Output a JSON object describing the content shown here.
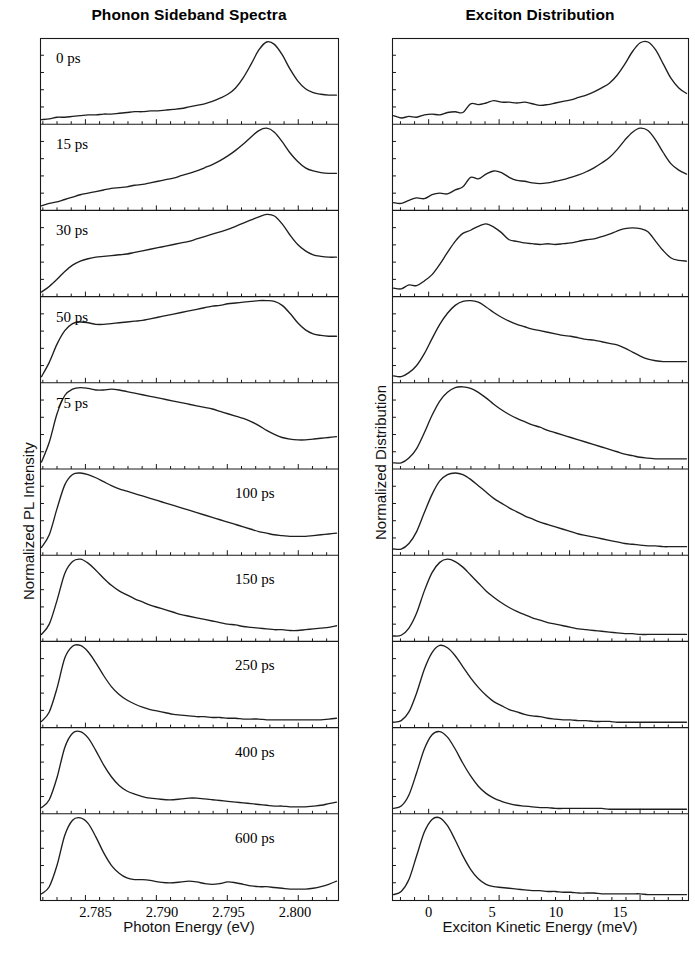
{
  "figure": {
    "columns": [
      {
        "key": "left",
        "title": "Phonon Sideband Spectra",
        "xlabel": "Photon Energy (eV)",
        "ylabel": "Normalized PL Intensity",
        "xticks": [
          "2.785",
          "2.790",
          "2.795",
          "2.800"
        ],
        "xtick_px": [
          95.5,
          162.0,
          228.5,
          295.0
        ]
      },
      {
        "key": "right",
        "title": "Exciton Distribution",
        "xlabel": "Exciton Kinetic Energy (meV)",
        "ylabel": "Normalized Distribution",
        "xticks": [
          "0",
          "5",
          "10",
          "15"
        ],
        "xtick_px": [
          428.5,
          492.0,
          556.0,
          620.0
        ]
      }
    ],
    "panel_labels": [
      "0 ps",
      "15 ps",
      "30 ps",
      "50 ps",
      "75 ps",
      "100 ps",
      "150 ps",
      "250 ps",
      "400 ps",
      "600 ps"
    ],
    "panel_label_side": [
      "left",
      "left",
      "left",
      "left",
      "left",
      "right",
      "right",
      "right",
      "right",
      "right"
    ],
    "colors": {
      "line": "#1f1f1f",
      "frame": "#1a1a1a",
      "background": "#ffffff",
      "text": "#000000"
    }
  },
  "chart_data": {
    "type": "line",
    "layout": "2 columns x 10 stacked time-delay panels, shared x axis per column",
    "grid": false,
    "legend": "none (each panel annotated with its time delay)",
    "time_delays_ps": [
      0,
      15,
      30,
      50,
      75,
      100,
      150,
      250,
      400,
      600
    ],
    "panels": [
      {
        "column": "left",
        "xlabel": "Photon Energy (eV)",
        "ylabel": "Normalized PL Intensity",
        "xlim": [
          2.7818,
          2.8028
        ],
        "xticks": [
          2.785,
          2.79,
          2.795,
          2.8
        ],
        "ylim": [
          0,
          1.05
        ],
        "series": [
          {
            "name": "0 ps",
            "y": [
              0.02,
              0.03,
              0.05,
              0.05,
              0.06,
              0.07,
              0.08,
              0.08,
              0.09,
              0.09,
              0.1,
              0.11,
              0.12,
              0.12,
              0.13,
              0.13,
              0.14,
              0.15,
              0.16,
              0.18,
              0.2,
              0.22,
              0.25,
              0.29,
              0.34,
              0.42,
              0.55,
              0.72,
              0.9,
              1.0,
              0.97,
              0.84,
              0.66,
              0.51,
              0.41,
              0.36,
              0.34,
              0.33,
              0.33
            ]
          },
          {
            "name": "15 ps",
            "y": [
              0.02,
              0.05,
              0.07,
              0.1,
              0.13,
              0.16,
              0.18,
              0.2,
              0.22,
              0.24,
              0.25,
              0.26,
              0.28,
              0.29,
              0.31,
              0.33,
              0.35,
              0.37,
              0.4,
              0.43,
              0.46,
              0.5,
              0.54,
              0.59,
              0.65,
              0.72,
              0.8,
              0.89,
              0.97,
              1.0,
              0.95,
              0.83,
              0.69,
              0.58,
              0.5,
              0.46,
              0.44,
              0.43,
              0.43
            ]
          },
          {
            "name": "30 ps",
            "y": [
              0.02,
              0.09,
              0.18,
              0.28,
              0.36,
              0.41,
              0.44,
              0.46,
              0.47,
              0.48,
              0.49,
              0.5,
              0.52,
              0.54,
              0.56,
              0.58,
              0.6,
              0.62,
              0.64,
              0.66,
              0.69,
              0.72,
              0.75,
              0.78,
              0.81,
              0.85,
              0.89,
              0.93,
              0.97,
              1.0,
              0.98,
              0.88,
              0.74,
              0.62,
              0.54,
              0.49,
              0.47,
              0.46,
              0.46
            ]
          },
          {
            "name": "50 ps",
            "y": [
              0.04,
              0.22,
              0.45,
              0.62,
              0.71,
              0.73,
              0.72,
              0.7,
              0.7,
              0.71,
              0.72,
              0.73,
              0.74,
              0.75,
              0.77,
              0.79,
              0.81,
              0.83,
              0.85,
              0.87,
              0.89,
              0.91,
              0.93,
              0.94,
              0.96,
              0.97,
              0.98,
              0.99,
              1.0,
              1.0,
              0.99,
              0.94,
              0.84,
              0.72,
              0.63,
              0.58,
              0.56,
              0.55,
              0.55
            ]
          },
          {
            "name": "75 ps",
            "y": [
              0.05,
              0.3,
              0.66,
              0.89,
              0.97,
              0.99,
              0.98,
              0.96,
              0.96,
              0.97,
              0.96,
              0.94,
              0.92,
              0.9,
              0.88,
              0.86,
              0.84,
              0.82,
              0.8,
              0.78,
              0.76,
              0.74,
              0.72,
              0.69,
              0.66,
              0.63,
              0.6,
              0.56,
              0.51,
              0.45,
              0.4,
              0.36,
              0.34,
              0.33,
              0.33,
              0.34,
              0.35,
              0.36,
              0.37
            ]
          },
          {
            "name": "100 ps",
            "y": [
              0.06,
              0.22,
              0.55,
              0.85,
              0.98,
              1.0,
              0.98,
              0.94,
              0.89,
              0.84,
              0.8,
              0.77,
              0.74,
              0.71,
              0.68,
              0.65,
              0.62,
              0.59,
              0.56,
              0.53,
              0.5,
              0.47,
              0.44,
              0.41,
              0.38,
              0.35,
              0.32,
              0.29,
              0.26,
              0.24,
              0.22,
              0.21,
              0.2,
              0.2,
              0.2,
              0.21,
              0.22,
              0.23,
              0.24
            ]
          },
          {
            "name": "150 ps",
            "y": [
              0.05,
              0.18,
              0.48,
              0.82,
              0.97,
              1.0,
              0.95,
              0.86,
              0.76,
              0.67,
              0.6,
              0.55,
              0.5,
              0.46,
              0.42,
              0.39,
              0.36,
              0.33,
              0.3,
              0.28,
              0.26,
              0.24,
              0.22,
              0.2,
              0.18,
              0.17,
              0.15,
              0.14,
              0.13,
              0.12,
              0.11,
              0.11,
              0.1,
              0.1,
              0.11,
              0.12,
              0.13,
              0.14,
              0.16
            ]
          },
          {
            "name": "250 ps",
            "y": [
              0.04,
              0.16,
              0.46,
              0.84,
              0.99,
              1.0,
              0.92,
              0.78,
              0.62,
              0.48,
              0.38,
              0.31,
              0.26,
              0.22,
              0.19,
              0.17,
              0.15,
              0.13,
              0.12,
              0.11,
              0.1,
              0.1,
              0.09,
              0.09,
              0.08,
              0.08,
              0.07,
              0.07,
              0.07,
              0.06,
              0.06,
              0.06,
              0.06,
              0.06,
              0.06,
              0.06,
              0.06,
              0.07,
              0.08
            ]
          },
          {
            "name": "400 ps",
            "y": [
              0.04,
              0.14,
              0.42,
              0.8,
              0.98,
              1.0,
              0.92,
              0.76,
              0.58,
              0.43,
              0.32,
              0.25,
              0.21,
              0.18,
              0.16,
              0.15,
              0.14,
              0.14,
              0.15,
              0.16,
              0.16,
              0.15,
              0.14,
              0.13,
              0.12,
              0.11,
              0.1,
              0.09,
              0.08,
              0.07,
              0.06,
              0.06,
              0.05,
              0.05,
              0.05,
              0.06,
              0.07,
              0.09,
              0.11
            ]
          },
          {
            "name": "600 ps",
            "y": [
              0.04,
              0.13,
              0.4,
              0.78,
              0.97,
              1.0,
              0.93,
              0.76,
              0.56,
              0.4,
              0.3,
              0.24,
              0.22,
              0.22,
              0.21,
              0.19,
              0.18,
              0.18,
              0.19,
              0.2,
              0.19,
              0.17,
              0.16,
              0.17,
              0.19,
              0.18,
              0.16,
              0.14,
              0.13,
              0.13,
              0.12,
              0.11,
              0.1,
              0.1,
              0.1,
              0.11,
              0.13,
              0.16,
              0.2
            ]
          }
        ]
      },
      {
        "column": "right",
        "xlabel": "Exciton Kinetic Energy (meV)",
        "ylabel": "Normalized Distribution",
        "xlim": [
          -2.6,
          18.4
        ],
        "xticks": [
          0,
          5,
          10,
          15
        ],
        "ylim": [
          0,
          1.05
        ],
        "series": [
          {
            "name": "0 ps",
            "y": [
              0.07,
              0.04,
              0.06,
              0.05,
              0.08,
              0.09,
              0.08,
              0.11,
              0.12,
              0.11,
              0.22,
              0.21,
              0.23,
              0.26,
              0.24,
              0.24,
              0.23,
              0.24,
              0.22,
              0.2,
              0.21,
              0.23,
              0.25,
              0.27,
              0.3,
              0.33,
              0.37,
              0.42,
              0.48,
              0.58,
              0.72,
              0.88,
              0.99,
              1.0,
              0.9,
              0.72,
              0.54,
              0.42,
              0.35
            ]
          },
          {
            "name": "15 ps",
            "y": [
              0.06,
              0.05,
              0.09,
              0.12,
              0.11,
              0.16,
              0.18,
              0.17,
              0.22,
              0.26,
              0.38,
              0.36,
              0.42,
              0.46,
              0.44,
              0.38,
              0.34,
              0.33,
              0.31,
              0.3,
              0.31,
              0.33,
              0.35,
              0.38,
              0.41,
              0.45,
              0.5,
              0.56,
              0.63,
              0.73,
              0.85,
              0.95,
              1.0,
              0.97,
              0.85,
              0.69,
              0.55,
              0.47,
              0.42
            ]
          },
          {
            "name": "30 ps",
            "y": [
              0.07,
              0.06,
              0.11,
              0.1,
              0.16,
              0.24,
              0.37,
              0.52,
              0.66,
              0.76,
              0.8,
              0.85,
              0.88,
              0.84,
              0.77,
              0.68,
              0.66,
              0.64,
              0.63,
              0.62,
              0.63,
              0.62,
              0.63,
              0.64,
              0.66,
              0.68,
              0.69,
              0.72,
              0.75,
              0.79,
              0.82,
              0.83,
              0.82,
              0.78,
              0.66,
              0.54,
              0.45,
              0.42,
              0.41
            ]
          },
          {
            "name": "50 ps",
            "y": [
              0.05,
              0.04,
              0.09,
              0.18,
              0.33,
              0.52,
              0.7,
              0.84,
              0.94,
              0.99,
              1.0,
              0.98,
              0.92,
              0.85,
              0.79,
              0.74,
              0.7,
              0.67,
              0.64,
              0.62,
              0.6,
              0.58,
              0.56,
              0.55,
              0.53,
              0.51,
              0.5,
              0.48,
              0.46,
              0.44,
              0.4,
              0.35,
              0.3,
              0.26,
              0.24,
              0.23,
              0.23,
              0.23,
              0.23
            ]
          },
          {
            "name": "75 ps",
            "y": [
              0.04,
              0.04,
              0.1,
              0.22,
              0.42,
              0.64,
              0.82,
              0.93,
              0.99,
              1.0,
              0.98,
              0.93,
              0.86,
              0.78,
              0.71,
              0.65,
              0.6,
              0.56,
              0.52,
              0.49,
              0.45,
              0.42,
              0.39,
              0.36,
              0.33,
              0.3,
              0.27,
              0.24,
              0.21,
              0.18,
              0.15,
              0.13,
              0.11,
              0.1,
              0.09,
              0.09,
              0.09,
              0.09,
              0.09
            ]
          },
          {
            "name": "100 ps",
            "y": [
              0.04,
              0.04,
              0.11,
              0.26,
              0.5,
              0.73,
              0.9,
              0.98,
              1.0,
              0.98,
              0.92,
              0.84,
              0.76,
              0.68,
              0.62,
              0.56,
              0.51,
              0.46,
              0.42,
              0.38,
              0.35,
              0.32,
              0.29,
              0.26,
              0.23,
              0.21,
              0.19,
              0.17,
              0.15,
              0.13,
              0.11,
              0.1,
              0.09,
              0.08,
              0.08,
              0.07,
              0.07,
              0.07,
              0.07
            ]
          },
          {
            "name": "150 ps",
            "y": [
              0.03,
              0.04,
              0.13,
              0.32,
              0.6,
              0.83,
              0.96,
              1.0,
              0.97,
              0.9,
              0.8,
              0.7,
              0.6,
              0.52,
              0.45,
              0.39,
              0.34,
              0.3,
              0.26,
              0.23,
              0.2,
              0.18,
              0.16,
              0.14,
              0.12,
              0.11,
              0.1,
              0.09,
              0.08,
              0.07,
              0.06,
              0.06,
              0.05,
              0.05,
              0.05,
              0.05,
              0.05,
              0.05,
              0.05
            ]
          },
          {
            "name": "250 ps",
            "y": [
              0.03,
              0.05,
              0.16,
              0.4,
              0.7,
              0.91,
              1.0,
              0.97,
              0.87,
              0.73,
              0.59,
              0.47,
              0.37,
              0.29,
              0.24,
              0.19,
              0.16,
              0.13,
              0.11,
              0.1,
              0.08,
              0.07,
              0.06,
              0.06,
              0.05,
              0.05,
              0.04,
              0.04,
              0.04,
              0.03,
              0.03,
              0.03,
              0.03,
              0.03,
              0.03,
              0.03,
              0.03,
              0.03,
              0.03
            ]
          },
          {
            "name": "400 ps",
            "y": [
              0.03,
              0.06,
              0.2,
              0.48,
              0.78,
              0.96,
              1.0,
              0.93,
              0.78,
              0.6,
              0.44,
              0.31,
              0.22,
              0.16,
              0.12,
              0.09,
              0.07,
              0.06,
              0.05,
              0.04,
              0.04,
              0.03,
              0.03,
              0.03,
              0.03,
              0.03,
              0.03,
              0.03,
              0.02,
              0.02,
              0.02,
              0.02,
              0.02,
              0.02,
              0.02,
              0.02,
              0.02,
              0.02,
              0.02
            ]
          },
          {
            "name": "600 ps",
            "y": [
              0.03,
              0.07,
              0.22,
              0.52,
              0.82,
              0.98,
              1.0,
              0.9,
              0.72,
              0.52,
              0.35,
              0.23,
              0.16,
              0.13,
              0.12,
              0.11,
              0.1,
              0.09,
              0.08,
              0.08,
              0.07,
              0.07,
              0.06,
              0.06,
              0.05,
              0.05,
              0.05,
              0.04,
              0.04,
              0.04,
              0.04,
              0.04,
              0.04,
              0.03,
              0.03,
              0.03,
              0.03,
              0.03,
              0.03
            ]
          }
        ]
      }
    ]
  }
}
